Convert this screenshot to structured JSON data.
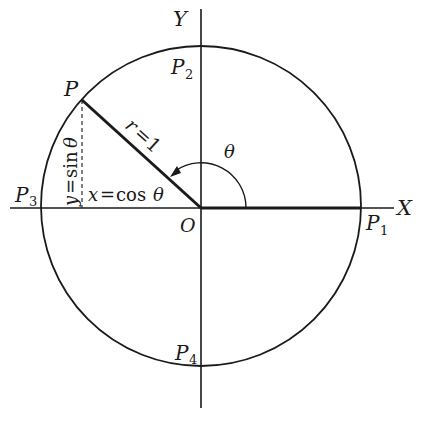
{
  "diagram": {
    "type": "unit circle",
    "axes": {
      "x_label": "X",
      "y_label": "Y",
      "origin_label": "O"
    },
    "points": {
      "P": "P",
      "P1": {
        "base": "P",
        "sub": "1"
      },
      "P2": {
        "base": "P",
        "sub": "2"
      },
      "P3": {
        "base": "P",
        "sub": "3"
      },
      "P4": {
        "base": "P",
        "sub": "4"
      }
    },
    "radius_label": "r = 1",
    "radius_lhs": "r",
    "radius_rhs": "1",
    "angle_label": "θ",
    "x_projection": {
      "var": "x",
      "eq": "=",
      "fn": "cos",
      "arg": "θ"
    },
    "y_projection": {
      "var": "y",
      "eq": "=",
      "fn": "sin",
      "arg": "θ"
    },
    "colors": {
      "ink": "#1a1a1a",
      "background": "#ffffff"
    }
  }
}
